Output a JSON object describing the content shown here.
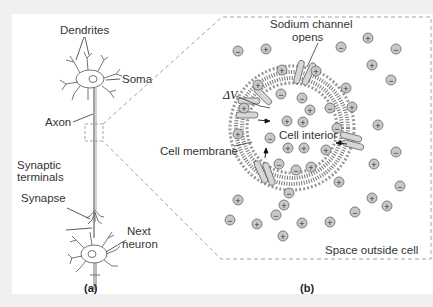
{
  "figure": {
    "panel_a": {
      "tag": "(a)",
      "labels": {
        "dendrites": "Dendrites",
        "soma": "Soma",
        "axon": "Axon",
        "synaptic_terminals_1": "Synaptic",
        "synaptic_terminals_2": "terminals",
        "synapse": "Synapse",
        "next_neuron_1": "Next",
        "next_neuron_2": "neuron"
      }
    },
    "panel_b": {
      "tag": "(b)",
      "labels": {
        "sodium_channel_1": "Sodium channel",
        "sodium_channel_2": "opens",
        "delta_v": "ΔV",
        "cell_interior": "Cell interior",
        "cell_membrane": "Cell membrane",
        "space_outside": "Space outside cell"
      },
      "ion_symbols": {
        "positive": "+",
        "negative": "−"
      }
    },
    "colors": {
      "background": "#efefef",
      "panel": "#ffffff",
      "ion_fill": "#c8c8c8",
      "line": "#555555",
      "dashed_border": "#8a8a8a"
    }
  }
}
